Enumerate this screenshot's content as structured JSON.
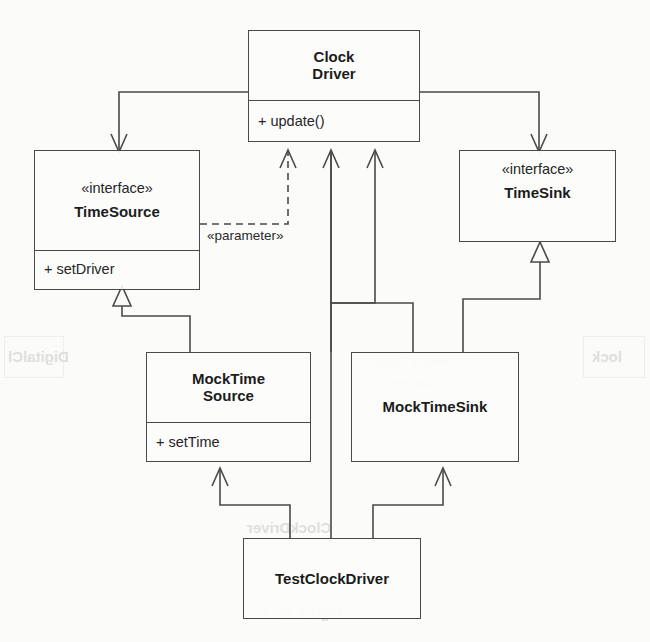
{
  "diagram": {
    "kind": "uml-class-diagram",
    "background_color": "#fbfbfa",
    "line_color": "#4a4a4a",
    "text_color": "#1c1c1c",
    "classes": [
      {
        "id": "clock-driver",
        "stereotype": "",
        "name_line1": "Clock",
        "name_line2": "Driver",
        "operations": [
          "+ update()"
        ]
      },
      {
        "id": "time-source",
        "stereotype": "«interface»",
        "name_line1": "TimeSource",
        "name_line2": "",
        "operations": [
          "+ setDriver"
        ]
      },
      {
        "id": "time-sink",
        "stereotype": "«interface»",
        "name_line1": "TimeSink",
        "name_line2": "",
        "operations": []
      },
      {
        "id": "mock-time-source",
        "stereotype": "",
        "name_line1": "MockTime",
        "name_line2": "Source",
        "operations": [
          "+ setTime"
        ]
      },
      {
        "id": "mock-time-sink",
        "stereotype": "",
        "name_line1": "MockTimeSink",
        "name_line2": "",
        "operations": []
      },
      {
        "id": "test-clock-driver",
        "stereotype": "",
        "name_line1": "TestClockDriver",
        "name_line2": "",
        "operations": []
      }
    ],
    "edge_labels": [
      {
        "id": "parameter-label",
        "text": "«parameter»"
      }
    ],
    "relationships": [
      {
        "from": "clock-driver",
        "to": "time-source",
        "type": "association",
        "arrow": "open-arrow"
      },
      {
        "from": "clock-driver",
        "to": "time-sink",
        "type": "association",
        "arrow": "open-arrow"
      },
      {
        "from": "time-source",
        "to": "clock-driver",
        "type": "dependency",
        "arrow": "open-arrow",
        "line": "dashed",
        "label": "«parameter»"
      },
      {
        "from": "mock-time-source",
        "to": "clock-driver",
        "type": "association",
        "arrow": "open-arrow"
      },
      {
        "from": "mock-time-sink",
        "to": "clock-driver",
        "type": "association",
        "arrow": "open-arrow"
      },
      {
        "from": "mock-time-source",
        "to": "time-source",
        "type": "generalization",
        "arrow": "hollow-triangle"
      },
      {
        "from": "mock-time-sink",
        "to": "time-sink",
        "type": "generalization",
        "arrow": "hollow-triangle"
      },
      {
        "from": "test-clock-driver",
        "to": "mock-time-source",
        "type": "association",
        "arrow": "open-arrow"
      },
      {
        "from": "test-clock-driver",
        "to": "mock-time-sink",
        "type": "association",
        "arrow": "open-arrow"
      },
      {
        "from": "test-clock-driver",
        "to": "clock-driver",
        "type": "association",
        "arrow": "none"
      }
    ],
    "ghost_texts": [
      {
        "id": "ghost-digital-clock",
        "text": "DigitalCl"
      },
      {
        "id": "ghost-clock",
        "text": "lock"
      },
      {
        "id": "ghost-mock-time-1",
        "text": "MockTime"
      },
      {
        "id": "ghost-mock-time-2",
        "text": "Source"
      },
      {
        "id": "ghost-figure",
        "text": "Figure 26-?"
      },
      {
        "id": "ghost-caption",
        "text": "ClockDriver"
      }
    ]
  }
}
